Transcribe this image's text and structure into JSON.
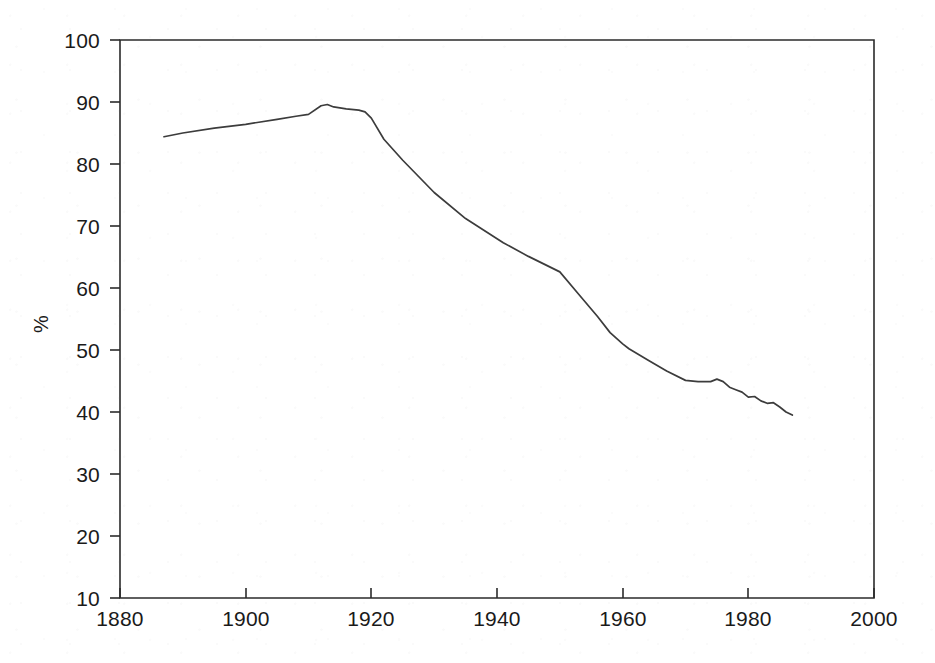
{
  "chart_data": {
    "type": "line",
    "title": "",
    "subtitle": "",
    "xlabel": "",
    "ylabel": "%",
    "xlim": [
      1880,
      2000
    ],
    "ylim": [
      10,
      100
    ],
    "x_ticks": [
      1880,
      1900,
      1920,
      1940,
      1960,
      1980,
      2000
    ],
    "y_ticks": [
      10,
      20,
      30,
      40,
      50,
      60,
      70,
      80,
      90,
      100
    ],
    "grid": false,
    "legend": "none",
    "series": [
      {
        "name": "percentage",
        "x": [
          1887,
          1890,
          1895,
          1900,
          1905,
          1908,
          1910,
          1912,
          1913,
          1914,
          1916,
          1918,
          1919,
          1920,
          1922,
          1925,
          1930,
          1935,
          1941,
          1945,
          1950,
          1953,
          1956,
          1958,
          1960,
          1961,
          1964,
          1967,
          1970,
          1972,
          1974,
          1975,
          1976,
          1977,
          1978,
          1979,
          1980,
          1981,
          1982,
          1983,
          1984,
          1985,
          1986,
          1987
        ],
        "values": [
          84.4,
          85.0,
          85.8,
          86.4,
          87.2,
          87.7,
          88.0,
          89.4,
          89.6,
          89.2,
          88.9,
          88.7,
          88.4,
          87.4,
          84.0,
          80.6,
          75.4,
          71.2,
          67.3,
          65.1,
          62.6,
          59.0,
          55.4,
          52.8,
          51.0,
          50.2,
          48.4,
          46.6,
          45.1,
          44.9,
          44.9,
          45.3,
          44.9,
          44.0,
          43.6,
          43.2,
          42.4,
          42.5,
          41.8,
          41.4,
          41.5,
          40.8,
          40.0,
          39.5
        ]
      }
    ]
  },
  "axes": {
    "y_axis_label": "%",
    "y_tick_labels": [
      "100",
      "90",
      "80",
      "70",
      "60",
      "50",
      "40",
      "30",
      "20",
      "10"
    ],
    "x_tick_labels": [
      "1880",
      "1900",
      "1920",
      "1940",
      "1960",
      "1980",
      "2000"
    ]
  },
  "colors": {
    "line": "#3c3c3c",
    "axis": "#2b2b2b",
    "background": "#ffffff",
    "text": "#1a1a1a"
  }
}
